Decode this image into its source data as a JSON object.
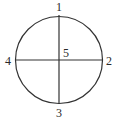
{
  "diagram": {
    "labels": {
      "top": "1",
      "right": "2",
      "bottom": "3",
      "left": "4",
      "center": "5"
    },
    "stroke_color": "#333333"
  }
}
